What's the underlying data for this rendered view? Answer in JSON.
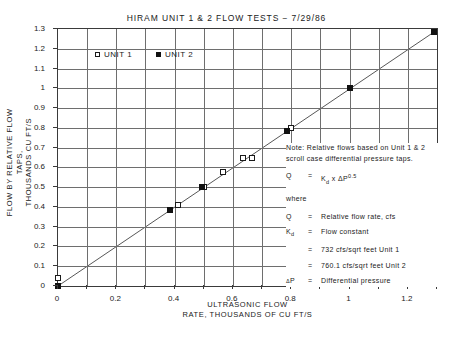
{
  "chart_data": {
    "type": "scatter",
    "title": "HIRAM  UNIT  1  &  2  FLOW  TESTS − 7/29/86",
    "xlabel": "ULTRASONIC  FLOW\nRATE, THOUSANDS  OF  CU  FT/S",
    "xlabel_line1": "ULTRASONIC  FLOW",
    "xlabel_line2": "RATE, THOUSANDS  OF  CU  FT/S",
    "ylabel_line1": "FLOW  BY  RELATIVE  FLOW  TAPS,",
    "ylabel_line2": "THOUSANDS  CU  FT/S",
    "xlim": [
      0,
      1.3
    ],
    "ylim": [
      0,
      1.3
    ],
    "grid": true,
    "xticks_major": [
      0,
      0.2,
      0.4,
      0.6,
      0.8,
      1,
      1.2
    ],
    "xticklabels": [
      "0",
      "0.2",
      "0.4",
      "0.6",
      "0.8",
      "1",
      "1.2"
    ],
    "xticks_minor": [
      0.1,
      0.3,
      0.5,
      0.7,
      0.9,
      1.1,
      1.3
    ],
    "yticks": [
      0,
      0.1,
      0.2,
      0.3,
      0.4,
      0.5,
      0.6,
      0.7,
      0.8,
      0.9,
      1,
      1.1,
      1.2,
      1.3
    ],
    "yticklabels": [
      "0",
      "0.1",
      "0.2",
      "0.3",
      "0.4",
      "0.5",
      "0.6",
      "0.7",
      "0.8",
      "0.9",
      "1",
      "1.1",
      "1.2",
      "1.3"
    ],
    "legend_position": "upper left inside",
    "series": [
      {
        "name": "UNIT 1",
        "marker": "open-square",
        "points": [
          {
            "x": 0.0,
            "y": 0.04
          },
          {
            "x": 0.0,
            "y": 0.0
          },
          {
            "x": 0.41,
            "y": 0.41
          },
          {
            "x": 0.5,
            "y": 0.5
          },
          {
            "x": 0.565,
            "y": 0.575
          },
          {
            "x": 0.635,
            "y": 0.645
          },
          {
            "x": 0.665,
            "y": 0.645
          },
          {
            "x": 0.8,
            "y": 0.8
          }
        ]
      },
      {
        "name": "UNIT 2",
        "marker": "filled-square",
        "points": [
          {
            "x": 0.0,
            "y": 0.0
          },
          {
            "x": 0.385,
            "y": 0.385
          },
          {
            "x": 0.495,
            "y": 0.5
          },
          {
            "x": 0.785,
            "y": 0.785
          },
          {
            "x": 1.0,
            "y": 1.0
          },
          {
            "x": 1.29,
            "y": 1.285
          }
        ]
      }
    ],
    "fit_line": {
      "x0": 0.0,
      "y0": 0.0,
      "x1": 1.29,
      "y1": 1.285
    }
  },
  "legend": {
    "unit1": "UNIT  1",
    "unit2": "UNIT  2"
  },
  "note": {
    "intro": "Note: Relative flows based on Unit 1 & 2 scroll case differential pressure taps.",
    "equation_q": "Q",
    "equation_eq": "=",
    "equation_rhs_k": "K",
    "equation_rhs_ksub": "d",
    "equation_rhs_x": "x",
    "equation_rhs_delta": "Δ",
    "equation_rhs_p": "P",
    "equation_rhs_exp": "0.5",
    "where": "where",
    "def_q_sym": "Q",
    "def_q_eq": "=",
    "def_q_txt": "Relative flow rate, cfs",
    "def_kd_sym": "K",
    "def_kd_sub": "d",
    "def_kd_eq": "=",
    "def_kd_txt": "Flow constant",
    "kd_unit1_eq": "=",
    "kd_unit1_txt": "732  cfs/sqrt feet Unit 1",
    "kd_unit2_eq": "=",
    "kd_unit2_txt": "760.1  cfs/sqrt feet Unit 2",
    "dp_sym_delta": "Δ",
    "dp_sym_p": "P",
    "dp_eq": "=",
    "dp_txt": "Differential pressure"
  },
  "colors": {
    "frame": "#3a3a3a",
    "grid": "#6e6e6e",
    "marker": "#111111",
    "line": "#444444"
  }
}
